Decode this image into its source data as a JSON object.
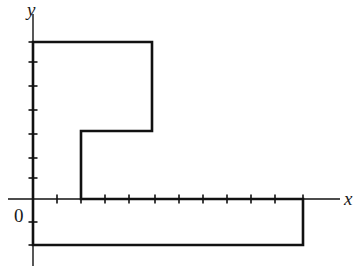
{
  "figure": {
    "background_color": "#ffffff",
    "ink_color": "#111111",
    "width": 359,
    "height": 266
  },
  "axes": {
    "x_axis": {
      "label": "x",
      "label_x": 344,
      "label_y": 205,
      "line": {
        "x1": 8,
        "y1": 199,
        "x2": 340,
        "y2": 199
      },
      "stroke_width": 1.4,
      "tick_length": 9,
      "tick_spacing": 24,
      "ticks": [
        57,
        81,
        105,
        129,
        155,
        179,
        203,
        227,
        251,
        275,
        303
      ]
    },
    "y_axis": {
      "label": "y",
      "label_x": 27,
      "label_y": 16,
      "line": {
        "x1": 33,
        "y1": 14,
        "x2": 33,
        "y2": 266
      },
      "stroke_width": 1.4,
      "tick_length": 9,
      "tick_spacing": 24,
      "ticks": [
        42,
        62,
        86,
        110,
        134,
        158,
        178,
        222,
        245
      ]
    },
    "origin": {
      "label": "0",
      "label_x": 14,
      "label_y": 222,
      "x": 33,
      "y": 199
    }
  },
  "shape": {
    "name": "l-shaped-polygon",
    "stroke_width": 2.6,
    "fill": "none",
    "points": [
      {
        "x": 33,
        "y": 42
      },
      {
        "x": 152,
        "y": 42
      },
      {
        "x": 152,
        "y": 131
      },
      {
        "x": 81,
        "y": 131
      },
      {
        "x": 81,
        "y": 199
      },
      {
        "x": 303,
        "y": 199
      },
      {
        "x": 303,
        "y": 245
      },
      {
        "x": 33,
        "y": 245
      }
    ],
    "closing_edge": {
      "from": {
        "x": 33,
        "y": 245
      },
      "to": {
        "x": 33,
        "y": 42
      }
    },
    "vertex_count": 8
  },
  "chart_data": {
    "type": "line",
    "xlabel": "x",
    "ylabel": "y",
    "grid": false,
    "legend": "none",
    "unit_pixels": 24,
    "xlim": [
      -1,
      13
    ],
    "ylim": [
      -3,
      7
    ],
    "x_ticks": [
      1,
      2,
      3,
      4,
      5,
      6,
      7,
      8,
      9,
      10,
      11
    ],
    "y_ticks": [
      -2,
      -1,
      1,
      2,
      3,
      4,
      5,
      6.5
    ],
    "series": [
      {
        "name": "polygon-outline",
        "closed": true,
        "x": [
          0,
          5,
          5,
          2,
          2,
          11.25,
          11.25,
          0
        ],
        "y": [
          6.5,
          6.5,
          2.8,
          2.8,
          0,
          0,
          -1.9,
          -1.9
        ]
      }
    ]
  }
}
